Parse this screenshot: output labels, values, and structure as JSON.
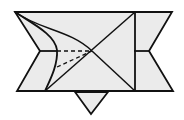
{
  "diagram": {
    "type": "origami-fold-step",
    "colors": {
      "fill": "#ebebeb",
      "stroke": "#111111",
      "background": "#ffffff"
    },
    "shapes": {
      "main_body": "15,12 172,12 149,51 173,91 17,91 40,51",
      "bottom_flap": "75,92 108,92 91,114"
    },
    "lines": {
      "vertical_crease": {
        "x1": 135,
        "y1": 12,
        "x2": 135,
        "y2": 91
      },
      "diag_a": {
        "x1": 135,
        "y1": 12,
        "x2": 45,
        "y2": 91
      },
      "diag_b": {
        "x1": 92,
        "y1": 51,
        "x2": 135,
        "y2": 91
      },
      "left_notch_tick": {
        "x1": 40,
        "y1": 51,
        "x2": 57,
        "y2": 51
      },
      "right_notch_tick": {
        "x1": 134,
        "y1": 51,
        "x2": 149,
        "y2": 51
      }
    },
    "curves": {
      "upper_curve": "M15,12 C40,30 70,30 92,51",
      "inner_curve": "M15,12 C35,25 55,35 57,50 C58,65 50,80 45,91",
      "outer_line": "M15,12 L40,51"
    },
    "dashed": {
      "dash_top": {
        "x1": 57,
        "y1": 51,
        "x2": 92,
        "y2": 51
      },
      "dash_bottom": {
        "x1": 57,
        "y1": 67,
        "x2": 92,
        "y2": 51
      }
    }
  }
}
